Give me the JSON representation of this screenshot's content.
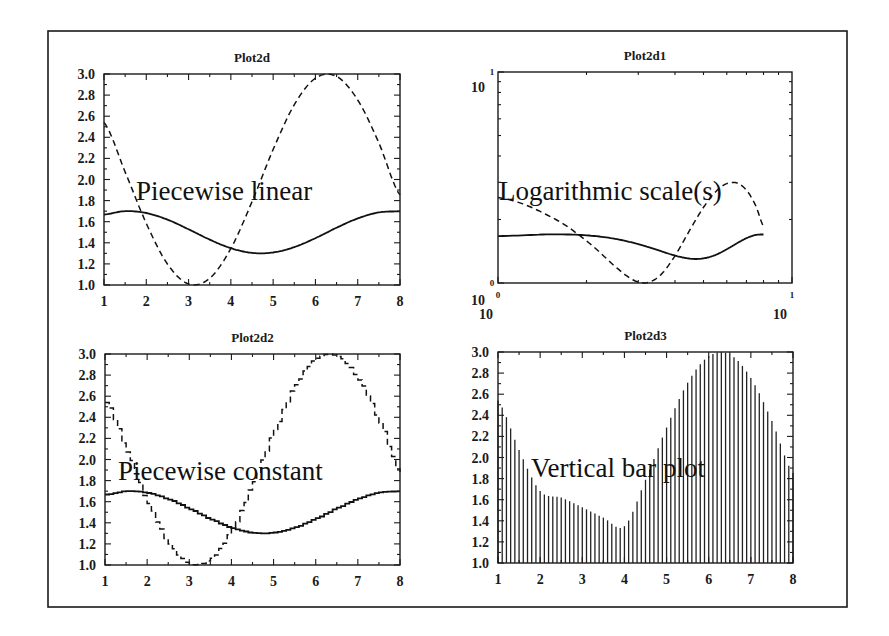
{
  "frame": {
    "x": 48,
    "y": 31,
    "width": 799,
    "height": 576
  },
  "chart_data": [
    {
      "id": "plot2d",
      "type": "line",
      "title": "Plot2d",
      "annotation": "Piecewise linear",
      "xlabel": "",
      "ylabel": "",
      "xlim": [
        1,
        8
      ],
      "ylim": [
        1.0,
        3.0
      ],
      "x_scale": "linear",
      "y_scale": "linear",
      "xticks": [
        "1",
        "2",
        "3",
        "4",
        "5",
        "6",
        "7",
        "8"
      ],
      "yticks": [
        "1.0",
        "1.2",
        "1.4",
        "1.6",
        "1.8",
        "2.0",
        "2.2",
        "2.4",
        "2.6",
        "2.8",
        "3.0"
      ],
      "grid": false,
      "series": [
        {
          "name": "1.5+0.2*sin(x)",
          "style": "solid",
          "x": [
            1,
            1.5,
            2,
            2.5,
            3,
            3.5,
            4,
            4.5,
            5,
            5.5,
            6,
            6.5,
            7,
            7.5,
            8
          ],
          "values": [
            1.668,
            1.7,
            1.682,
            1.62,
            1.528,
            1.43,
            1.349,
            1.304,
            1.308,
            1.359,
            1.444,
            1.543,
            1.631,
            1.688,
            1.698
          ]
        },
        {
          "name": "2+cos(x)",
          "style": "dashed",
          "x": [
            1,
            1.5,
            2,
            2.5,
            3,
            3.5,
            4,
            4.5,
            5,
            5.5,
            6,
            6.5,
            7,
            7.5,
            8
          ],
          "values": [
            2.54,
            2.071,
            1.584,
            1.199,
            1.01,
            1.064,
            1.346,
            1.789,
            2.284,
            2.709,
            2.96,
            2.977,
            2.754,
            2.347,
            1.854
          ]
        }
      ]
    },
    {
      "id": "plot2d1",
      "type": "line",
      "title": "Plot2d1",
      "annotation": "Logarithmic scale(s)",
      "xlabel": "",
      "ylabel": "",
      "xlim": [
        1,
        10
      ],
      "ylim": [
        1,
        10
      ],
      "x_scale": "log",
      "y_scale": "log",
      "xticks": [
        "10^0",
        "10^1"
      ],
      "yticks": [
        "10^0",
        "10^1"
      ],
      "grid": false,
      "series": [
        {
          "name": "1.5+0.2*sin(x)",
          "style": "solid",
          "x": [
            1,
            1.5,
            2,
            2.5,
            3,
            3.5,
            4,
            4.5,
            5,
            5.5,
            6,
            6.5,
            7,
            7.5,
            8
          ],
          "values": [
            1.668,
            1.7,
            1.682,
            1.62,
            1.528,
            1.43,
            1.349,
            1.304,
            1.308,
            1.359,
            1.444,
            1.543,
            1.631,
            1.688,
            1.698
          ]
        },
        {
          "name": "2+cos(x)",
          "style": "dashed",
          "x": [
            1,
            1.5,
            2,
            2.5,
            3,
            3.5,
            4,
            4.5,
            5,
            5.5,
            6,
            6.5,
            7,
            7.5,
            8
          ],
          "values": [
            2.54,
            2.071,
            1.584,
            1.199,
            1.01,
            1.064,
            1.346,
            1.789,
            2.284,
            2.709,
            2.96,
            2.977,
            2.754,
            2.347,
            1.854
          ]
        }
      ]
    },
    {
      "id": "plot2d2",
      "type": "line",
      "title": "Plot2d2",
      "annotation": "Piecewise constant",
      "xlabel": "",
      "ylabel": "",
      "xlim": [
        1,
        8
      ],
      "ylim": [
        1.0,
        3.0
      ],
      "x_scale": "linear",
      "y_scale": "linear",
      "xticks": [
        "1",
        "2",
        "3",
        "4",
        "5",
        "6",
        "7",
        "8"
      ],
      "yticks": [
        "1.0",
        "1.2",
        "1.4",
        "1.6",
        "1.8",
        "2.0",
        "2.2",
        "2.4",
        "2.6",
        "2.8",
        "3.0"
      ],
      "grid": false,
      "drawstyle": "steps",
      "series": [
        {
          "name": "1.5+0.2*sin(x)",
          "style": "solid",
          "x": [
            1,
            1.5,
            2,
            2.5,
            3,
            3.5,
            4,
            4.5,
            5,
            5.5,
            6,
            6.5,
            7,
            7.5,
            8
          ],
          "values": [
            1.668,
            1.7,
            1.682,
            1.62,
            1.528,
            1.43,
            1.349,
            1.304,
            1.308,
            1.359,
            1.444,
            1.543,
            1.631,
            1.688,
            1.698
          ]
        },
        {
          "name": "2+cos(x)",
          "style": "dashed",
          "x": [
            1,
            1.5,
            2,
            2.5,
            3,
            3.5,
            4,
            4.5,
            5,
            5.5,
            6,
            6.5,
            7,
            7.5,
            8
          ],
          "values": [
            2.54,
            2.071,
            1.584,
            1.199,
            1.01,
            1.064,
            1.346,
            1.789,
            2.284,
            2.709,
            2.96,
            2.977,
            2.754,
            2.347,
            1.854
          ]
        }
      ]
    },
    {
      "id": "plot2d3",
      "type": "bar",
      "title": "Plot2d3",
      "annotation": "Vertical bar plot",
      "xlabel": "",
      "ylabel": "",
      "xlim": [
        1,
        8
      ],
      "ylim": [
        1.0,
        3.0
      ],
      "x_scale": "linear",
      "y_scale": "linear",
      "xticks": [
        "1",
        "2",
        "3",
        "4",
        "5",
        "6",
        "7",
        "8"
      ],
      "yticks": [
        "1.0",
        "1.2",
        "1.4",
        "1.6",
        "1.8",
        "2.0",
        "2.2",
        "2.4",
        "2.6",
        "2.8",
        "3.0"
      ],
      "grid": false,
      "bar_count": 71,
      "series": [
        {
          "name": "max(1.5+0.2*sin(x), 2+cos(x))",
          "x": [
            1,
            1.5,
            2,
            2.5,
            3,
            3.5,
            4,
            4.5,
            5,
            5.5,
            6,
            6.5,
            7,
            7.5,
            8
          ],
          "values": [
            2.54,
            2.071,
            1.682,
            1.62,
            1.528,
            1.43,
            1.349,
            1.789,
            2.284,
            2.709,
            2.96,
            2.977,
            2.754,
            2.347,
            1.854
          ]
        }
      ]
    }
  ],
  "layout": {
    "panels": [
      {
        "left": 104,
        "top": 74,
        "right": 400,
        "bottom": 285
      },
      {
        "left": 498,
        "top": 72,
        "right": 792,
        "bottom": 283
      },
      {
        "left": 105,
        "top": 354,
        "right": 400,
        "bottom": 565
      },
      {
        "left": 498,
        "top": 352,
        "right": 793,
        "bottom": 563
      }
    ]
  }
}
